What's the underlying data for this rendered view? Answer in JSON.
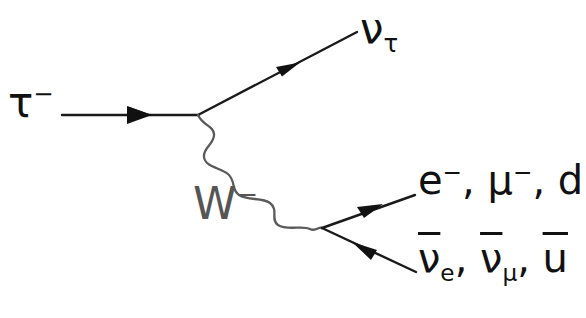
{
  "figure": {
    "kind": "feynman-diagram",
    "title_visible": false,
    "background_color": "#ffffff",
    "line_color": "#111111",
    "propagator_color": "#555555"
  },
  "labels": {
    "incoming_particle": {
      "name": "tau-lepton",
      "base": "τ",
      "charge": "−",
      "text": "τ⁻"
    },
    "outgoing_neutrino": {
      "name": "tau-neutrino",
      "base": "ν",
      "subscript": "τ",
      "text": "ντ"
    },
    "propagator": {
      "name": "w-boson",
      "base": "W",
      "charge": "−",
      "text": "W⁻",
      "color": "#555555"
    },
    "fermion_products": {
      "name": "down-type-fermions",
      "items": [
        "e⁻",
        "μ⁻",
        "d"
      ],
      "separator": ", ",
      "parts": {
        "first_base": "e",
        "first_charge": "−",
        "second_base": "μ",
        "second_charge": "−",
        "third_base": "d"
      }
    },
    "antifermion_products": {
      "name": "antifermion-partners",
      "items": [
        "ν̄e",
        "ν̄μ",
        "ū"
      ],
      "separator": ", ",
      "parts": {
        "first_base": "ν",
        "first_sub": "e",
        "second_base": "ν",
        "second_sub": "μ",
        "third_base": "u"
      }
    },
    "comma": ","
  },
  "geometry": {
    "upper_vertex": {
      "x": 198,
      "y": 115
    },
    "lower_vertex": {
      "x": 322,
      "y": 228
    },
    "tau_line": {
      "x1": 62,
      "y1": 115,
      "x2": 198,
      "y2": 115
    },
    "neutrino_line": {
      "x1": 198,
      "y1": 115,
      "x2": 356,
      "y2": 32
    },
    "fermion_line": {
      "x1": 322,
      "y1": 228,
      "x2": 414,
      "y2": 195
    },
    "antifermion_line": {
      "x1": 414,
      "y1": 272,
      "x2": 322,
      "y2": 228
    },
    "wave_amplitude": 9,
    "wave_cycles": 4.5
  }
}
